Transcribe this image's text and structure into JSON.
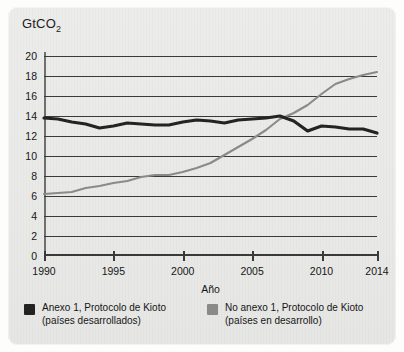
{
  "chart_data": {
    "type": "line",
    "title": "",
    "subtitle": "",
    "unit_label": "GtCO",
    "unit_sub": "2",
    "xlabel": "Año",
    "ylabel": "GtCO2",
    "xlim": [
      1990,
      2014
    ],
    "ylim": [
      0,
      20
    ],
    "grid": true,
    "legend_position": "bottom",
    "ytick_labels": [
      "20",
      "18",
      "16",
      "14",
      "12",
      "10",
      "8",
      "6",
      "4",
      "2",
      "0"
    ],
    "ytick_values": [
      20,
      18,
      16,
      14,
      12,
      10,
      8,
      6,
      4,
      2,
      0
    ],
    "xtick_labels": [
      "1990",
      "1995",
      "2000",
      "2005",
      "2010",
      "2014"
    ],
    "xtick_values": [
      1990,
      1995,
      2000,
      2005,
      2010,
      2014
    ],
    "x": [
      1990,
      1991,
      1992,
      1993,
      1994,
      1995,
      1996,
      1997,
      1998,
      1999,
      2000,
      2001,
      2002,
      2003,
      2004,
      2005,
      2006,
      2007,
      2008,
      2009,
      2010,
      2011,
      2012,
      2013,
      2014
    ],
    "series": [
      {
        "name": "Anexo 1, Protocolo de Kioto",
        "sublabel": "(países desarrollados)",
        "color": "#232323",
        "values": [
          13.8,
          13.7,
          13.4,
          13.2,
          12.8,
          13.0,
          13.3,
          13.2,
          13.1,
          13.1,
          13.4,
          13.6,
          13.5,
          13.3,
          13.6,
          13.7,
          13.8,
          14.0,
          13.5,
          12.5,
          13.0,
          12.9,
          12.7,
          12.7,
          12.3
        ]
      },
      {
        "name": "No anexo 1, Protocolo de Kioto",
        "sublabel": "(países en desarrollo)",
        "color": "#8a8a8a",
        "values": [
          6.2,
          6.3,
          6.4,
          6.8,
          7.0,
          7.3,
          7.5,
          7.9,
          8.1,
          8.1,
          8.4,
          8.8,
          9.3,
          10.1,
          10.9,
          11.7,
          12.6,
          13.7,
          14.3,
          15.1,
          16.2,
          17.2,
          17.7,
          18.1,
          18.4
        ]
      }
    ]
  },
  "legend": {
    "entries": [
      {
        "label": "Anexo 1, Protocolo de Kioto",
        "sublabel": "(países desarrollados)",
        "color": "#232323"
      },
      {
        "label": "No anexo 1, Protocolo de Kioto",
        "sublabel": "(países en desarrollo)",
        "color": "#8a8a8a"
      }
    ]
  },
  "colors": {
    "card_background": "#eaeae8",
    "axis": "#3a3a3a",
    "grid": "#3a3a3a",
    "text": "#161616",
    "annex1": "#232323",
    "non_annex1": "#8a8a8a"
  }
}
